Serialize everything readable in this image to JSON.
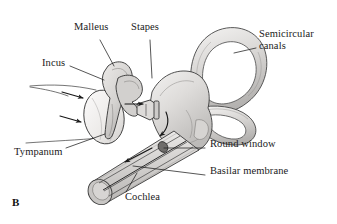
{
  "figure": {
    "panel_letter": "B",
    "background_color": "#ffffff",
    "ink_color": "#1a1a1a",
    "shade_light": "#e8e7e6",
    "shade_mid": "#cfcdcb",
    "shade_dark": "#b0aeac"
  },
  "labels": [
    {
      "id": "malleus",
      "text": "Malleus",
      "x": 74,
      "y": 27
    },
    {
      "id": "stapes",
      "text": "Stapes",
      "x": 131,
      "y": 27
    },
    {
      "id": "semicircular_canals",
      "text": "Semicircular canals",
      "x": 259,
      "y": 34
    },
    {
      "id": "incus",
      "text": "Incus",
      "x": 42,
      "y": 63
    },
    {
      "id": "tympanum",
      "text": "Tympanum",
      "x": 14,
      "y": 152
    },
    {
      "id": "round_window",
      "text": "Round window",
      "x": 208,
      "y": 144
    },
    {
      "id": "basilar_membrane",
      "text": "Basilar membrane",
      "x": 208,
      "y": 171
    },
    {
      "id": "cochlea",
      "text": "Cochlea",
      "x": 125,
      "y": 197
    }
  ],
  "leader_lines": [
    {
      "id": "malleus-leader",
      "from": [
        100,
        40
      ],
      "to": [
        114,
        66
      ]
    },
    {
      "id": "stapes-leader",
      "from": [
        150,
        40
      ],
      "to": [
        152,
        78
      ]
    },
    {
      "id": "semicircular-canals-leader",
      "from": [
        256,
        48
      ],
      "to": [
        234,
        53
      ]
    },
    {
      "id": "incus-leader",
      "from": [
        70,
        66
      ],
      "to": [
        104,
        80
      ]
    },
    {
      "id": "tympanum-leader",
      "from": [
        66,
        148
      ],
      "to": [
        105,
        134
      ]
    },
    {
      "id": "round-window-leader",
      "from": [
        205,
        148
      ],
      "to": [
        164,
        148
      ]
    },
    {
      "id": "basilar-membrane-leader",
      "from": [
        205,
        175
      ],
      "to": [
        133,
        166
      ]
    },
    {
      "id": "cochlea-leader",
      "from": [
        126,
        192
      ],
      "to": [
        137,
        173
      ]
    }
  ],
  "flow_arrows": [
    {
      "id": "sound-wave-arrow-upper",
      "meaning": "sound waves toward tympanum"
    },
    {
      "id": "sound-wave-arrow-lower",
      "meaning": "sound waves toward tympanum"
    },
    {
      "id": "oval-window-arrow",
      "meaning": "stapes pushes oval window inward"
    },
    {
      "id": "vestibule-arrow",
      "meaning": "pressure wave down vestibule"
    },
    {
      "id": "cochlear-fluid-arrow",
      "meaning": "fluid wave travels along cochlea"
    }
  ]
}
